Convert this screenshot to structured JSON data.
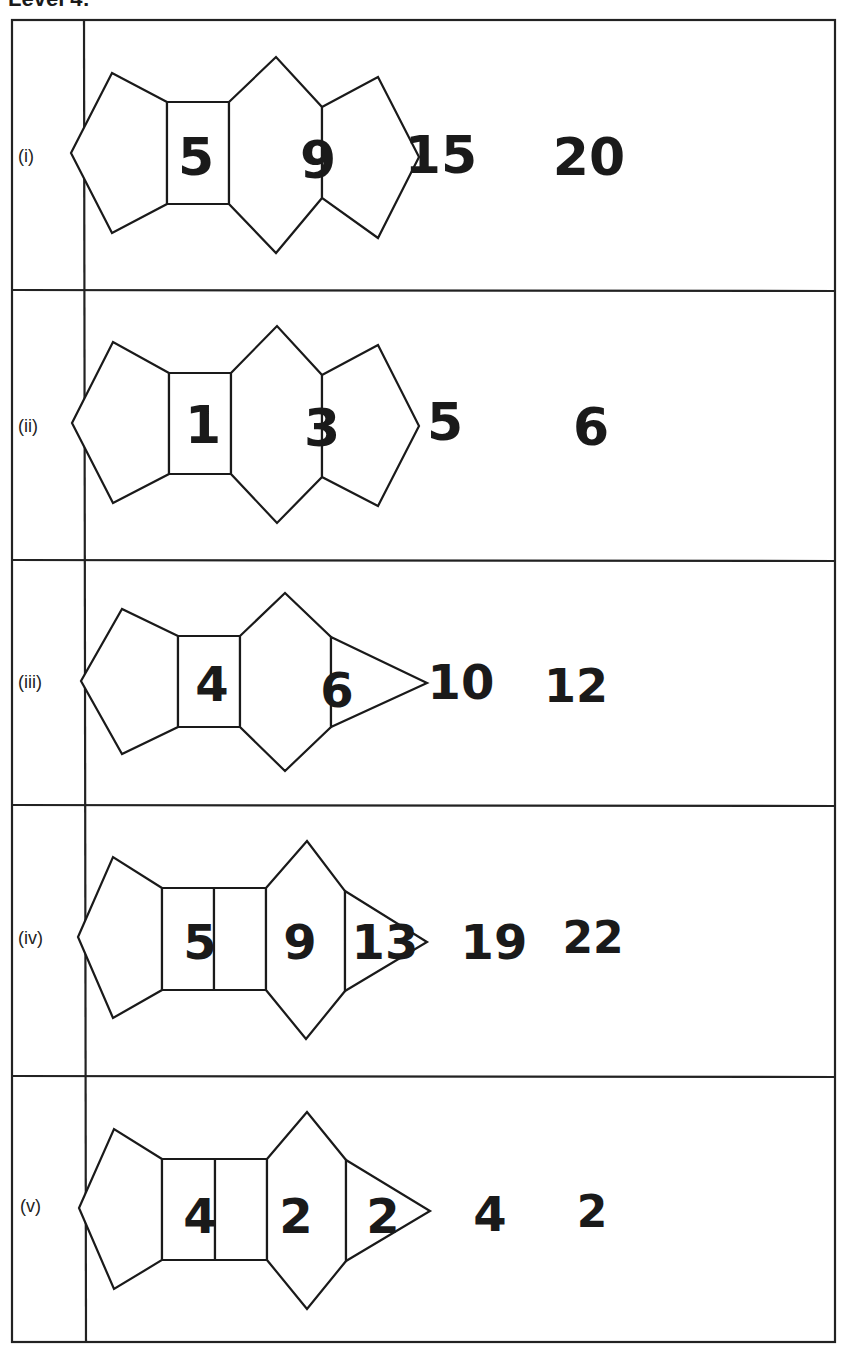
{
  "title": "Level 4:",
  "rows": [
    {
      "label": "(i)",
      "numbers": [
        "5",
        "9",
        "15",
        "20"
      ]
    },
    {
      "label": "(ii)",
      "numbers": [
        "1",
        "3",
        "5",
        "6"
      ]
    },
    {
      "label": "(iii)",
      "numbers": [
        "4",
        "6",
        "10",
        "12"
      ]
    },
    {
      "label": "(iv)",
      "numbers": [
        "5",
        "9",
        "13",
        "19",
        "22"
      ]
    },
    {
      "label": "(v)",
      "numbers": [
        "4",
        "2",
        "2",
        "4",
        "2"
      ]
    }
  ],
  "colors": {
    "ink": "#1a1a1a",
    "background": "#ffffff"
  }
}
